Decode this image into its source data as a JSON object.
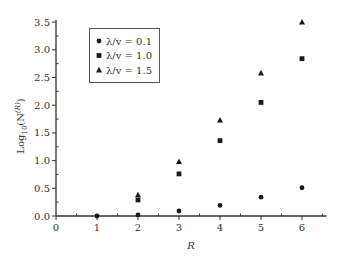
{
  "chart_data": {
    "type": "scatter",
    "title": "",
    "xlabel": "R",
    "ylabel": "Log10(N^(R))",
    "ylabel_parts": {
      "base": "Log",
      "sub": "10",
      "open": "(N",
      "sup": "(R)",
      "close": ")"
    },
    "xlim": [
      0,
      6.5
    ],
    "ylim": [
      0,
      3.5
    ],
    "xticks": [
      0,
      1,
      2,
      3,
      4,
      5,
      6
    ],
    "xtick_labels": [
      "0",
      "1",
      "2",
      "3",
      "4",
      "5",
      "6"
    ],
    "yticks": [
      0.0,
      0.5,
      1.0,
      1.5,
      2.0,
      2.5,
      3.0,
      3.5
    ],
    "ytick_labels": [
      "0.0",
      "0.5",
      "1.0",
      "1.5",
      "2.0",
      "2.5",
      "3.0",
      "3.5"
    ],
    "grid": false,
    "legend_position": "upper left",
    "series": [
      {
        "name": "λ/v = 0.1",
        "marker": "circle",
        "x": [
          1,
          2,
          3,
          4,
          5,
          6
        ],
        "y": [
          0.0,
          0.02,
          0.09,
          0.19,
          0.34,
          0.51
        ]
      },
      {
        "name": "λ/v = 1.0",
        "marker": "square",
        "x": [
          2,
          3,
          4,
          5,
          6
        ],
        "y": [
          0.29,
          0.76,
          1.36,
          2.05,
          2.84
        ]
      },
      {
        "name": "λ/v = 1.5",
        "marker": "triangle",
        "x": [
          2,
          3,
          4,
          5,
          6
        ],
        "y": [
          0.38,
          0.98,
          1.73,
          2.58,
          3.5
        ]
      }
    ],
    "colors": {
      "marker": "#1a1a1a",
      "axis": "#333333",
      "legend_border": "#555555"
    }
  },
  "legend": {
    "items": [
      {
        "label": "λ/v = 0.1",
        "marker": "circle"
      },
      {
        "label": "λ/v = 1.0",
        "marker": "square"
      },
      {
        "label": "λ/v = 1.5",
        "marker": "triangle"
      }
    ]
  }
}
